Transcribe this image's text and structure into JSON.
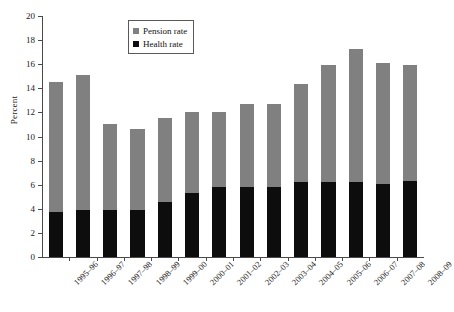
{
  "chart_data": {
    "type": "bar",
    "subtype": "stacked-vertical",
    "title": "",
    "xlabel": "",
    "ylabel": "Percent",
    "ylim": [
      0,
      20
    ],
    "yticks": [
      0,
      2,
      4,
      6,
      8,
      10,
      12,
      14,
      16,
      18,
      20
    ],
    "grid": false,
    "legend_position": "top-center-left",
    "categories": [
      "1995–96",
      "1996–97",
      "1997–98",
      "1998–99",
      "1999–00",
      "2000–01",
      "2001–02",
      "2002–03",
      "2003–04",
      "2004–05",
      "2005–06",
      "2006–07",
      "2007–08",
      "2008–09"
    ],
    "series": [
      {
        "name": "Health rate",
        "color": "#0d0d0d",
        "values": [
          3.7,
          3.9,
          3.9,
          3.9,
          4.6,
          5.3,
          5.8,
          5.8,
          5.8,
          6.2,
          6.2,
          6.2,
          6.1,
          6.3
        ]
      },
      {
        "name": "Pension rate",
        "color": "#808080",
        "values": [
          10.8,
          11.2,
          7.1,
          6.7,
          6.9,
          6.7,
          6.2,
          6.9,
          6.9,
          8.2,
          9.7,
          11.1,
          10.0,
          9.6
        ]
      }
    ],
    "totals": [
      14.5,
      15.1,
      11.0,
      10.6,
      11.5,
      12.0,
      12.0,
      12.7,
      12.7,
      14.4,
      15.9,
      17.3,
      16.1,
      15.9
    ]
  },
  "legend": {
    "items": [
      {
        "label": "Pension rate",
        "color": "#808080"
      },
      {
        "label": "Health rate",
        "color": "#0d0d0d"
      }
    ]
  }
}
